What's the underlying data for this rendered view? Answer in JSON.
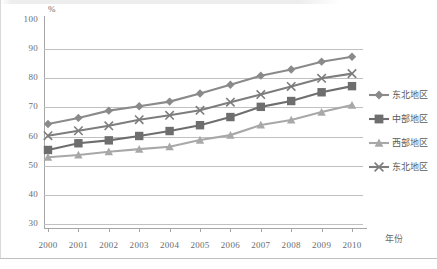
{
  "chart_data": {
    "type": "line",
    "title": "",
    "xlabel": "年份",
    "ylabel": "%",
    "ylim": [
      30,
      100
    ],
    "ytick_step": 10,
    "yticks": [
      "100",
      "90",
      "80",
      "70",
      "60",
      "50",
      "40",
      "30"
    ],
    "grid": true,
    "legend_position": "right",
    "categories": [
      "2000",
      "2001",
      "2002",
      "2003",
      "2004",
      "2005",
      "2006",
      "2007",
      "2008",
      "2009",
      "2010"
    ],
    "series": [
      {
        "name": "东北地区",
        "marker": "diamond",
        "color": "#8a8a8a",
        "values": [
          64.3,
          66.4,
          68.9,
          70.4,
          72.0,
          74.8,
          77.8,
          80.9,
          83.0,
          85.7,
          87.4
        ]
      },
      {
        "name": "中部地区",
        "marker": "square",
        "color": "#6e6e6e",
        "values": [
          55.4,
          57.7,
          58.7,
          60.2,
          61.9,
          63.9,
          66.7,
          70.2,
          72.2,
          75.2,
          77.3
        ]
      },
      {
        "name": "西部地区",
        "marker": "triangle",
        "color": "#a8a8a8",
        "values": [
          52.9,
          53.7,
          54.8,
          55.7,
          56.5,
          58.8,
          60.5,
          64.0,
          65.7,
          68.4,
          70.8
        ]
      },
      {
        "name": "东北地区",
        "marker": "cross",
        "color": "#7d7d7d",
        "values": [
          60.3,
          62.0,
          63.7,
          65.8,
          67.3,
          69.0,
          71.8,
          74.4,
          77.2,
          80.0,
          81.6
        ]
      }
    ]
  },
  "legend": {
    "items": [
      {
        "label": "东北地区",
        "marker": "diamond"
      },
      {
        "label": "中部地区",
        "marker": "square"
      },
      {
        "label": "西部地区",
        "marker": "triangle"
      },
      {
        "label": "东北地区",
        "marker": "cross"
      }
    ]
  }
}
